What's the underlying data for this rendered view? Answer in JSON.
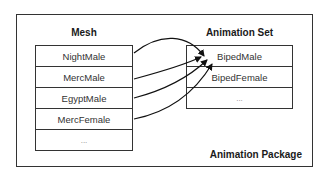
{
  "package": {
    "label": "Animation Package"
  },
  "mesh": {
    "title": "Mesh",
    "items": [
      "NightMale",
      "MercMale",
      "EgyptMale",
      "MercFemale",
      "..."
    ]
  },
  "animation_set": {
    "title": "Animation Set",
    "items": [
      "BipedMale",
      "BipedFemale",
      "..."
    ]
  },
  "connections": [
    {
      "from": "NightMale",
      "to": "BipedMale"
    },
    {
      "from": "MercMale",
      "to": "BipedMale"
    },
    {
      "from": "EgyptMale",
      "to": "BipedMale"
    },
    {
      "from": "MercFemale",
      "to": "BipedMale"
    }
  ]
}
